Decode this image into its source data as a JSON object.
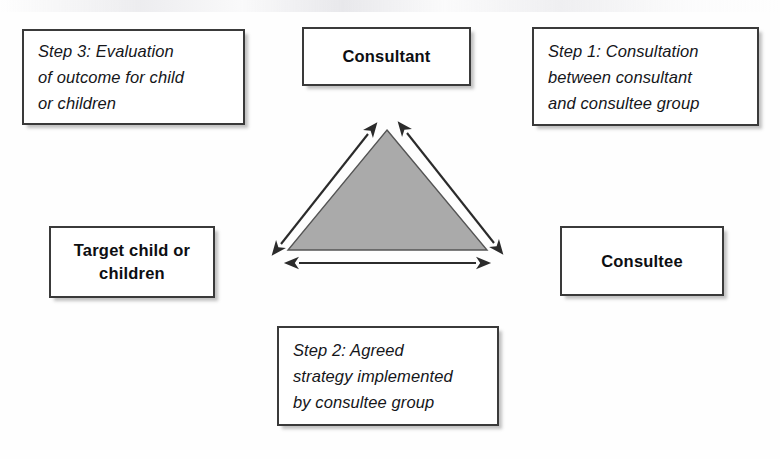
{
  "diagram": {
    "type": "triangular-relationship-diagram",
    "colors": {
      "page_background": "#fefefe",
      "box_fill": "#ffffff",
      "box_border": "#3a3a3a",
      "box_shadow": "#787878",
      "triangle_fill": "#aaaaaa",
      "triangle_stroke": "#555555",
      "arrow_stroke": "#2b2b2b",
      "text": "#15161a"
    }
  },
  "boxes": {
    "step3": {
      "label": "Step 3: Evaluation of outcome for child or children",
      "lines": "Step 3: Evaluation\nof outcome for child\nor children",
      "style": "italic",
      "position": "top-left"
    },
    "consultant": {
      "label": "Consultant",
      "lines": "Consultant",
      "style": "bold",
      "position": "top-center"
    },
    "step1": {
      "label": "Step 1: Consultation between consultant and consultee group",
      "lines": "Step 1: Consultation\nbetween consultant\nand consultee group",
      "style": "italic",
      "position": "top-right"
    },
    "target_child": {
      "label": "Target child or children",
      "lines": "Target child or\nchildren",
      "style": "bold",
      "position": "middle-left"
    },
    "consultee": {
      "label": "Consultee",
      "lines": "Consultee",
      "style": "bold",
      "position": "middle-right"
    },
    "step2": {
      "label": "Step 2: Agreed strategy implemented by consultee group",
      "lines": "Step 2: Agreed\nstrategy implemented\nby consultee group",
      "style": "italic",
      "position": "bottom-center"
    }
  },
  "graphic": {
    "triangle": {
      "name": "shaded-triangle",
      "apex": {
        "x": 132,
        "y": 18
      },
      "base_left": {
        "x": 33,
        "y": 138
      },
      "base_right": {
        "x": 232,
        "y": 138
      },
      "fill": "#aaaaaa",
      "stroke": "#555555"
    },
    "arrows": [
      {
        "name": "arrow-consultant-to-target-child",
        "orientation": "double-headed",
        "from": {
          "x": 26,
          "y": 132
        },
        "to": {
          "x": 113,
          "y": 22
        },
        "connects": [
          "target_child",
          "consultant"
        ]
      },
      {
        "name": "arrow-consultant-to-consultee",
        "orientation": "double-headed",
        "from": {
          "x": 152,
          "y": 21
        },
        "to": {
          "x": 239,
          "y": 131
        },
        "connects": [
          "consultant",
          "consultee"
        ]
      },
      {
        "name": "arrow-target-child-to-consultee",
        "orientation": "double-headed",
        "from": {
          "x": 44,
          "y": 151
        },
        "to": {
          "x": 221,
          "y": 151
        },
        "connects": [
          "target_child",
          "consultee"
        ]
      }
    ]
  }
}
